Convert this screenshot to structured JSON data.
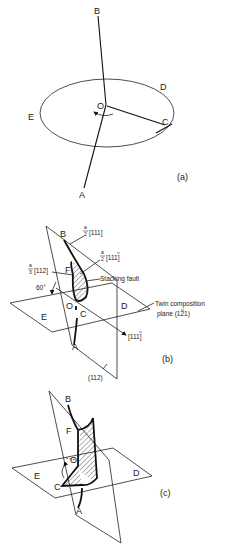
{
  "panels": [
    {
      "id": "a",
      "caption": "(a)",
      "points": {
        "A": "A",
        "B": "B",
        "C": "C",
        "D": "D",
        "E": "E",
        "O": "O"
      },
      "description": "Dislocation line AOB with segment OC rotating about O in plane (ellipse) ECD"
    },
    {
      "id": "b",
      "caption": "(b)",
      "points": {
        "A": "A",
        "B": "B",
        "C": "C",
        "D": "D",
        "E": "E",
        "F": "F",
        "O": "O"
      },
      "annotations": {
        "burgers_partial_111": "a/2[111]",
        "burgers_partial_11-1": "a/2[11̅1]",
        "shockley_112": "a/3[112]",
        "angle": "60°",
        "stacking_fault": "Stacking fault",
        "twin_plane_line1": "Twin composition",
        "twin_plane_line2": "plane (̅1̅2̅1)",
        "direction_111": "[111̅]",
        "plane_112": "(112)"
      },
      "fractions": {
        "a2_num": "a",
        "a2_den": "2",
        "a3_num": "a",
        "a3_den": "3",
        "idx_111": "[111]",
        "idx_11bar1": "[111]",
        "idx_112": "[112]",
        "idx_11bar1_dir": "[111]",
        "twin_plane": "plane (121)"
      }
    },
    {
      "id": "c",
      "caption": "(c)",
      "points": {
        "A": "A",
        "B": "B",
        "C": "C",
        "D": "D",
        "E": "E",
        "F": "F",
        "O": "O"
      }
    }
  ]
}
